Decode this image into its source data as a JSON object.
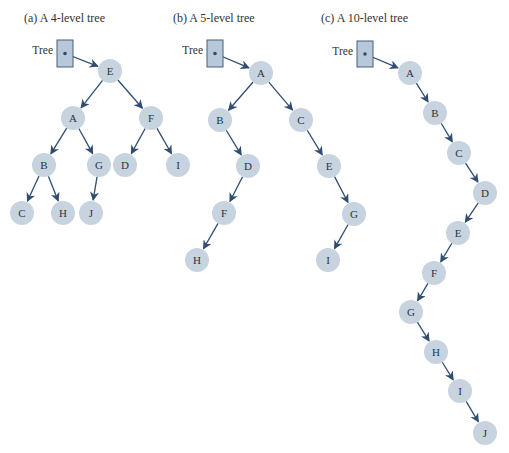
{
  "colors": {
    "node_fill": "#c7d3df",
    "edge": "#2f4d72",
    "root_box_fill": "#b6c8da",
    "root_box_stroke": "#4a5f78"
  },
  "trees": [
    {
      "caption": "(a) A 4-level tree",
      "caption_x": 24,
      "root_label": "Tree",
      "root_box": {
        "x": 57,
        "y": 40,
        "w": 16,
        "h": 27
      },
      "root_target": "E",
      "nodes": [
        {
          "id": "E",
          "x": 110,
          "y": 71
        },
        {
          "id": "A",
          "x": 73,
          "y": 118
        },
        {
          "id": "F",
          "x": 151,
          "y": 118
        },
        {
          "id": "B",
          "x": 44,
          "y": 165
        },
        {
          "id": "G",
          "x": 99,
          "y": 165
        },
        {
          "id": "D",
          "x": 125,
          "y": 165
        },
        {
          "id": "I",
          "x": 178,
          "y": 165
        },
        {
          "id": "C",
          "x": 22,
          "y": 213
        },
        {
          "id": "H",
          "x": 63,
          "y": 213
        },
        {
          "id": "J",
          "x": 91,
          "y": 213
        }
      ],
      "edges": [
        [
          "E",
          "A"
        ],
        [
          "E",
          "F"
        ],
        [
          "A",
          "B"
        ],
        [
          "A",
          "G"
        ],
        [
          "F",
          "D"
        ],
        [
          "F",
          "I"
        ],
        [
          "B",
          "C"
        ],
        [
          "B",
          "H"
        ],
        [
          "G",
          "J"
        ]
      ]
    },
    {
      "caption": "(b) A 5-level tree",
      "caption_x": 173,
      "root_label": "Tree",
      "root_box": {
        "x": 207,
        "y": 40,
        "w": 16,
        "h": 27
      },
      "root_target": "A",
      "nodes": [
        {
          "id": "A",
          "x": 261,
          "y": 73
        },
        {
          "id": "B",
          "x": 220,
          "y": 120
        },
        {
          "id": "C",
          "x": 301,
          "y": 120
        },
        {
          "id": "D",
          "x": 248,
          "y": 166
        },
        {
          "id": "E",
          "x": 329,
          "y": 166
        },
        {
          "id": "F",
          "x": 224,
          "y": 213
        },
        {
          "id": "G",
          "x": 354,
          "y": 214
        },
        {
          "id": "H",
          "x": 197,
          "y": 260
        },
        {
          "id": "I",
          "x": 328,
          "y": 260
        }
      ],
      "edges": [
        [
          "A",
          "B"
        ],
        [
          "A",
          "C"
        ],
        [
          "B",
          "D"
        ],
        [
          "C",
          "E"
        ],
        [
          "D",
          "F"
        ],
        [
          "E",
          "G"
        ],
        [
          "F",
          "H"
        ],
        [
          "G",
          "I"
        ]
      ]
    },
    {
      "caption": "(c) A 10-level tree",
      "caption_x": 321,
      "root_label": "Tree",
      "root_box": {
        "x": 357,
        "y": 41,
        "w": 16,
        "h": 26
      },
      "root_target": "A",
      "nodes": [
        {
          "id": "A",
          "x": 410,
          "y": 73
        },
        {
          "id": "B",
          "x": 435,
          "y": 113
        },
        {
          "id": "C",
          "x": 459,
          "y": 153
        },
        {
          "id": "D",
          "x": 485,
          "y": 193
        },
        {
          "id": "E",
          "x": 458,
          "y": 233
        },
        {
          "id": "F",
          "x": 434,
          "y": 273
        },
        {
          "id": "G",
          "x": 411,
          "y": 312
        },
        {
          "id": "H",
          "x": 436,
          "y": 352
        },
        {
          "id": "I",
          "x": 460,
          "y": 391
        },
        {
          "id": "J",
          "x": 485,
          "y": 433
        }
      ],
      "edges": [
        [
          "A",
          "B"
        ],
        [
          "B",
          "C"
        ],
        [
          "C",
          "D"
        ],
        [
          "D",
          "E"
        ],
        [
          "E",
          "F"
        ],
        [
          "F",
          "G"
        ],
        [
          "G",
          "H"
        ],
        [
          "H",
          "I"
        ],
        [
          "I",
          "J"
        ]
      ]
    }
  ]
}
